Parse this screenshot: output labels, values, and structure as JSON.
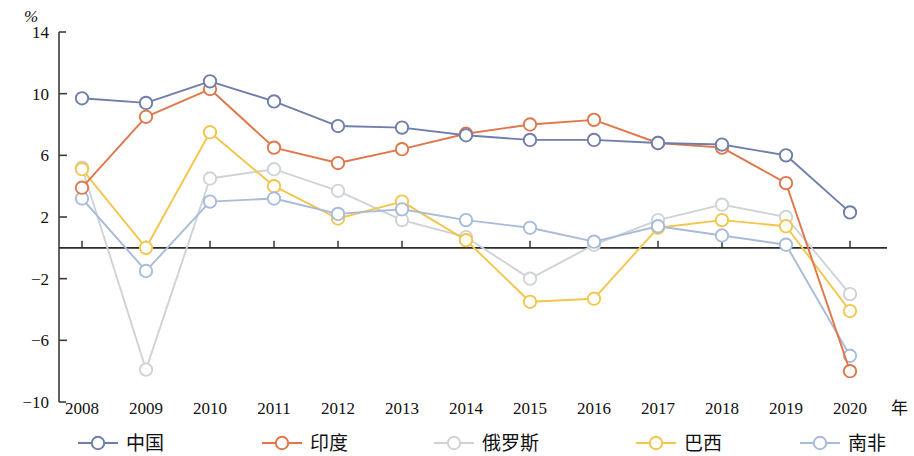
{
  "chart_data": {
    "type": "line",
    "title": "",
    "xlabel": "年",
    "ylabel": "%",
    "ylim": [
      -10,
      14
    ],
    "ytick_values": [
      14,
      10,
      6,
      2,
      -2,
      -6,
      -10
    ],
    "ytick_labels": [
      "14",
      "10",
      "6",
      "2",
      "−2",
      "−6",
      "−10"
    ],
    "zero_line": 0,
    "grid": false,
    "legend_position": "bottom",
    "categories": [
      "2008",
      "2009",
      "2010",
      "2011",
      "2012",
      "2013",
      "2014",
      "2015",
      "2016",
      "2017",
      "2018",
      "2019",
      "2020"
    ],
    "series": [
      {
        "name": "中国",
        "color": "#6f7eab",
        "values": [
          9.7,
          9.4,
          10.8,
          9.5,
          7.9,
          7.8,
          7.3,
          7.0,
          7.0,
          6.8,
          6.7,
          6.0,
          2.3
        ]
      },
      {
        "name": "印度",
        "color": "#e0764a",
        "values": [
          3.9,
          8.5,
          10.3,
          6.5,
          5.5,
          6.4,
          7.4,
          8.0,
          8.3,
          6.8,
          6.5,
          4.2,
          -8.0
        ]
      },
      {
        "name": "俄罗斯",
        "color": "#cfd3d6",
        "values": [
          5.2,
          -7.9,
          4.5,
          5.1,
          3.7,
          1.8,
          0.7,
          -2.0,
          0.2,
          1.8,
          2.8,
          2.0,
          -3.0
        ]
      },
      {
        "name": "巴西",
        "color": "#f3c64b",
        "values": [
          5.1,
          0.0,
          7.5,
          4.0,
          1.9,
          3.0,
          0.5,
          -3.5,
          -3.3,
          1.3,
          1.8,
          1.4,
          -4.1
        ]
      },
      {
        "name": "南非",
        "color": "#a8bcd8",
        "values": [
          3.2,
          -1.5,
          3.0,
          3.2,
          2.2,
          2.5,
          1.8,
          1.3,
          0.4,
          1.4,
          0.8,
          0.2,
          -7.0
        ]
      }
    ]
  },
  "axis": {
    "unit_label": "%",
    "year_label": "年"
  },
  "legend": {
    "items": [
      {
        "label": "中国",
        "color": "#6f7eab"
      },
      {
        "label": "印度",
        "color": "#e0764a"
      },
      {
        "label": "俄罗斯",
        "color": "#cfd3d6"
      },
      {
        "label": "巴西",
        "color": "#f3c64b"
      },
      {
        "label": "南非",
        "color": "#a8bcd8"
      }
    ]
  }
}
